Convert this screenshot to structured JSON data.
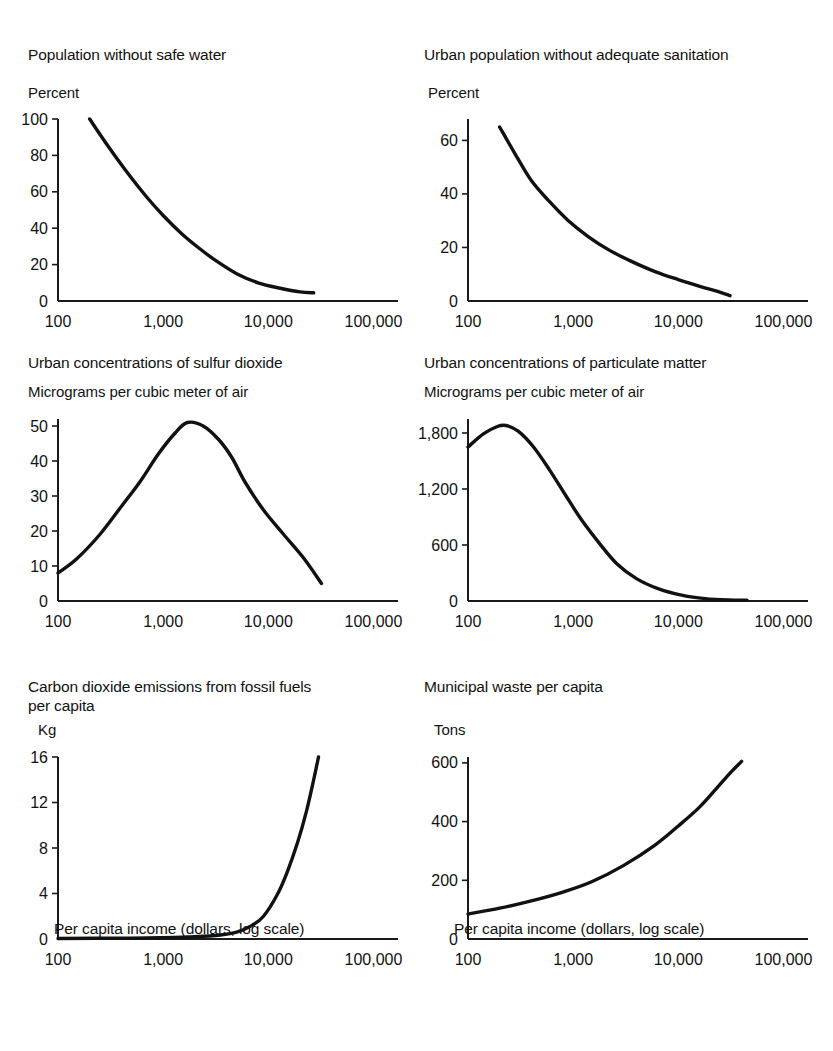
{
  "figure": {
    "background": "#ffffff",
    "curve_color": "#111111",
    "axis_color": "#1a1a1a"
  },
  "panels": [
    {
      "title": "Population without safe water",
      "unit": "Percent",
      "x_caption": "",
      "y_ticks": [
        "0",
        "20",
        "40",
        "60",
        "80",
        "100"
      ],
      "x_ticks": [
        "100",
        "1,000",
        "10,000",
        "100,000"
      ]
    },
    {
      "title": "Urban population without adequate sanitation",
      "unit": "Percent",
      "x_caption": "",
      "y_ticks": [
        "0",
        "20",
        "40",
        "60"
      ],
      "x_ticks": [
        "100",
        "1,000",
        "10,000",
        "100,000"
      ]
    },
    {
      "title": "Urban concentrations of sulfur dioxide",
      "unit": "Micrograms per cubic meter of air",
      "x_caption": "",
      "y_ticks": [
        "0",
        "10",
        "20",
        "30",
        "40",
        "50"
      ],
      "x_ticks": [
        "100",
        "1,000",
        "10,000",
        "100,000"
      ]
    },
    {
      "title": "Urban concentrations of particulate matter",
      "unit": "Micrograms per cubic meter of air",
      "x_caption": "",
      "y_ticks": [
        "0",
        "600",
        "1,200",
        "1,800"
      ],
      "x_ticks": [
        "100",
        "1,000",
        "10,000",
        "100,000"
      ]
    },
    {
      "title": "Carbon dioxide emissions from fossil fuels\nper capita",
      "unit": "Kg",
      "x_caption": "Per capita income (dollars, log scale)",
      "y_ticks": [
        "0",
        "4",
        "8",
        "12",
        "16"
      ],
      "x_ticks": [
        "100",
        "1,000",
        "10,000",
        "100,000"
      ]
    },
    {
      "title": "Municipal waste per capita",
      "unit": "Tons",
      "x_caption": "Per capita income (dollars, log scale)",
      "y_ticks": [
        "0",
        "200",
        "400",
        "600"
      ],
      "x_ticks": [
        "100",
        "1,000",
        "10,000",
        "100,000"
      ]
    }
  ],
  "chart_data": [
    {
      "type": "line",
      "title": "Population without safe water",
      "xlabel": "Per capita income (dollars, log scale)",
      "ylabel": "Percent",
      "xscale": "log",
      "xlim": [
        100,
        150000
      ],
      "ylim": [
        0,
        100
      ],
      "xticks": [
        100,
        1000,
        10000,
        100000
      ],
      "yticks": [
        0,
        20,
        40,
        60,
        80,
        100
      ],
      "grid": false,
      "legend": null,
      "x": [
        200,
        300,
        450,
        700,
        1000,
        1500,
        2200,
        3200,
        5000,
        8000,
        13000,
        20000,
        27000
      ],
      "values": [
        100,
        85,
        71,
        57,
        47,
        37,
        29,
        22,
        15,
        10,
        7,
        5,
        4.5
      ]
    },
    {
      "type": "line",
      "title": "Urban population without adequate sanitation",
      "xlabel": "Per capita income (dollars, log scale)",
      "ylabel": "Percent",
      "xscale": "log",
      "xlim": [
        100,
        150000
      ],
      "ylim": [
        0,
        68
      ],
      "xticks": [
        100,
        1000,
        10000,
        100000
      ],
      "yticks": [
        0,
        20,
        40,
        60
      ],
      "grid": false,
      "legend": null,
      "x": [
        200,
        280,
        400,
        600,
        900,
        1400,
        2200,
        3500,
        6000,
        10000,
        16000,
        24000,
        31000
      ],
      "values": [
        65,
        55,
        45,
        37,
        30,
        24,
        19,
        15,
        11,
        8,
        5.5,
        3.5,
        2
      ]
    },
    {
      "type": "line",
      "title": "Urban concentrations of sulfur dioxide",
      "xlabel": "Per capita income (dollars, log scale)",
      "ylabel": "Micrograms per cubic meter of air",
      "xscale": "log",
      "xlim": [
        100,
        150000
      ],
      "ylim": [
        0,
        52
      ],
      "xticks": [
        100,
        1000,
        10000,
        100000
      ],
      "yticks": [
        0,
        10,
        20,
        30,
        40,
        50
      ],
      "grid": false,
      "legend": null,
      "peak_x": 1700,
      "peak_y": 51,
      "x": [
        100,
        150,
        250,
        400,
        600,
        900,
        1300,
        1700,
        2400,
        3400,
        4500,
        6000,
        9000,
        14000,
        22000,
        32000
      ],
      "values": [
        8,
        12,
        19,
        27,
        34,
        42,
        48,
        51,
        50,
        46,
        41,
        34,
        26,
        19,
        12,
        5
      ]
    },
    {
      "type": "line",
      "title": "Urban concentrations of particulate matter",
      "xlabel": "Per capita income (dollars, log scale)",
      "ylabel": "Micrograms per cubic meter of air",
      "xscale": "log",
      "xlim": [
        100,
        150000
      ],
      "ylim": [
        0,
        1950
      ],
      "xticks": [
        100,
        1000,
        10000,
        100000
      ],
      "yticks": [
        0,
        600,
        1200,
        1800
      ],
      "grid": false,
      "legend": null,
      "peak_x": 230,
      "peak_y": 1880,
      "x": [
        100,
        140,
        190,
        230,
        300,
        420,
        600,
        850,
        1200,
        1800,
        2600,
        4000,
        6500,
        11000,
        18000,
        30000,
        45000
      ],
      "values": [
        1650,
        1790,
        1870,
        1880,
        1820,
        1650,
        1400,
        1130,
        870,
        610,
        400,
        240,
        130,
        60,
        25,
        10,
        8
      ]
    },
    {
      "type": "line",
      "title": "Carbon dioxide emissions from fossil fuels per capita",
      "xlabel": "Per capita income (dollars, log scale)",
      "ylabel": "Kg",
      "xscale": "log",
      "xlim": [
        100,
        150000
      ],
      "ylim": [
        0,
        16
      ],
      "xticks": [
        100,
        1000,
        10000,
        100000
      ],
      "yticks": [
        0,
        4,
        8,
        12,
        16
      ],
      "grid": false,
      "legend": null,
      "x": [
        100,
        500,
        1000,
        2000,
        3500,
        5000,
        7000,
        9000,
        12000,
        15000,
        19000,
        23000,
        27000,
        30000
      ],
      "values": [
        0.05,
        0.08,
        0.12,
        0.2,
        0.35,
        0.6,
        1.2,
        2.0,
        3.8,
        5.8,
        8.5,
        11.2,
        14.0,
        16.0
      ]
    },
    {
      "type": "line",
      "title": "Municipal waste per capita",
      "xlabel": "Per capita income (dollars, log scale)",
      "ylabel": "Tons",
      "xscale": "log",
      "xlim": [
        100,
        150000
      ],
      "ylim": [
        0,
        620
      ],
      "xticks": [
        100,
        1000,
        10000,
        100000
      ],
      "yticks": [
        0,
        200,
        400,
        600
      ],
      "grid": false,
      "legend": null,
      "x": [
        100,
        200,
        400,
        800,
        1500,
        3000,
        6000,
        10000,
        16000,
        24000,
        32000,
        40000
      ],
      "values": [
        85,
        105,
        130,
        160,
        195,
        250,
        320,
        385,
        450,
        520,
        570,
        605
      ]
    }
  ]
}
